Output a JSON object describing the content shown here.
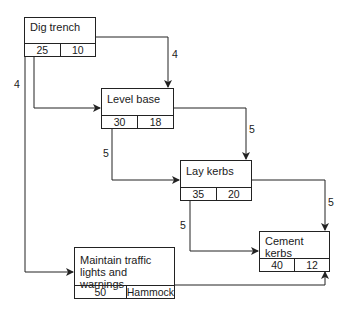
{
  "diagram": {
    "type": "activity-on-node network",
    "nodes": [
      {
        "id": "dig",
        "title": "Dig trench",
        "start": "25",
        "duration": "10"
      },
      {
        "id": "level",
        "title": "Level base",
        "start": "30",
        "duration": "18"
      },
      {
        "id": "lay",
        "title": "Lay kerbs",
        "start": "35",
        "duration": "20"
      },
      {
        "id": "cement",
        "title": "Cement kerbs",
        "start": "40",
        "duration": "12"
      },
      {
        "id": "maintain",
        "title": "Maintain traffic lights and warnings",
        "start": "50",
        "duration": "Hammock"
      }
    ],
    "edges": [
      {
        "from": "dig",
        "to": "level",
        "type": "start-to-start",
        "lag": "4"
      },
      {
        "from": "dig",
        "to": "level",
        "type": "finish-to-finish",
        "lag": "4"
      },
      {
        "from": "dig",
        "to": "maintain",
        "type": "start-to-start",
        "lag": "4"
      },
      {
        "from": "level",
        "to": "lay",
        "type": "start-to-start",
        "lag": "5"
      },
      {
        "from": "level",
        "to": "lay",
        "type": "finish-to-finish",
        "lag": "5"
      },
      {
        "from": "lay",
        "to": "cement",
        "type": "start-to-start",
        "lag": "5"
      },
      {
        "from": "lay",
        "to": "cement",
        "type": "finish-to-finish",
        "lag": "5"
      },
      {
        "from": "maintain",
        "to": "cement",
        "type": "finish-to-finish",
        "lag": ""
      }
    ]
  }
}
